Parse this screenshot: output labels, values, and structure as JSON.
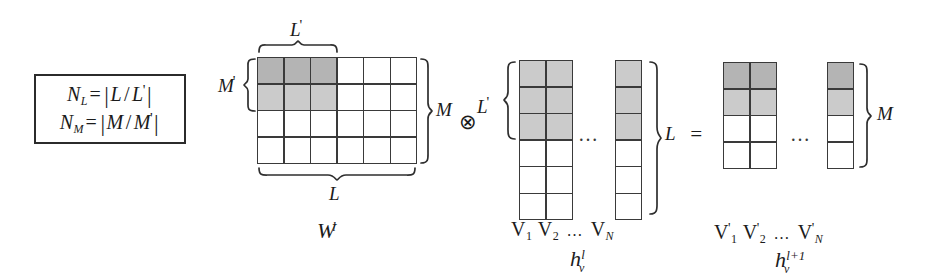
{
  "figure": {
    "caption_free": true
  },
  "formula_box": {
    "line1": {
      "lhs": "N",
      "lhs_sub": "L",
      "eq": "=",
      "numerator": "L",
      "slash": "/",
      "denominator": "L",
      "denominator_prime": "'"
    },
    "line2": {
      "lhs": "N",
      "lhs_sub": "M",
      "eq": "=",
      "numerator": "M",
      "slash": "/",
      "denominator": "M",
      "denominator_prime": "'"
    },
    "line1_text": "N_L = |L / L'|",
    "line2_text": "N_M = |M / M'|"
  },
  "weight_matrix": {
    "name": "W",
    "superscript": "l",
    "label_text": "W",
    "cols": 6,
    "rows": 4,
    "top_brace_label": "L",
    "top_brace_label_prime": "'",
    "bottom_brace_label": "L",
    "left_brace_label": "M",
    "left_brace_label_prime": "'",
    "right_brace_label": "M",
    "shaded_block_cols": 3,
    "shaded_block_rows": 2,
    "shade_row1": "#b4b4b4",
    "shade_row2": "#cbcbcb"
  },
  "tensor_operator": "⊗",
  "equals_operator": "=",
  "input_activations": {
    "name": "h",
    "subscript": "v",
    "superscript": "l",
    "label_text": "h",
    "rows": 6,
    "visible_cols": 2,
    "last_col_shown": true,
    "shaded_rows": 3,
    "shade": "#cbcbcb",
    "brace_label": "L",
    "brace_label_prime": "'",
    "right_brace_label": "L",
    "ellipsis": "…",
    "column_labels": [
      {
        "v": "V",
        "sub": "1",
        "prime": ""
      },
      {
        "v": "V",
        "sub": "2",
        "prime": ""
      },
      {
        "v": "V",
        "sub": "N",
        "prime": ""
      }
    ],
    "column_labels_text": "V1 V2 ... VN"
  },
  "output_activations": {
    "name": "h",
    "subscript": "v",
    "superscript": "l+1",
    "label_text": "h",
    "rows": 4,
    "visible_cols": 2,
    "last_col_shown": true,
    "shaded_rows": 2,
    "shade_row1": "#b4b4b4",
    "shade_row2": "#cbcbcb",
    "right_brace_label": "M",
    "ellipsis": "…",
    "column_labels": [
      {
        "v": "V",
        "sub": "1",
        "prime": "'"
      },
      {
        "v": "V",
        "sub": "2",
        "prime": "'"
      },
      {
        "v": "V",
        "sub": "N",
        "prime": "'"
      }
    ],
    "column_labels_text": "V'1 V'2 ... V'N"
  },
  "ellipsis_glyph": "…",
  "colors": {
    "ink": "#1b1b1b",
    "rule": "#3a3a3a",
    "shade_dark": "#b4b4b4",
    "shade_light": "#cbcbcb",
    "background": "#ffffff"
  }
}
